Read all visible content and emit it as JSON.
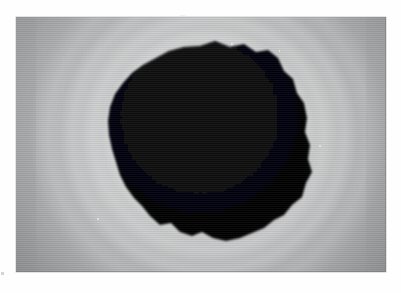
{
  "document": {
    "title": "Grayscale Specimen Micrograph",
    "background_color": "#fefefe",
    "width": 401,
    "height": 293
  },
  "plate": {
    "name": "photographic-plate",
    "x": 16,
    "y": 17,
    "width": 370,
    "height": 255,
    "corner_gray": "#6e7071",
    "mid_gray": "#a8a9aa",
    "halo_peak_gray": "#c4c5c6",
    "border_gray": "#c9cacb",
    "alt_text": "Backlit grayscale image of a dark, irregular rock-like specimen silhouetted against a bright diffuse halo with faint concentric rings",
    "modality": "transmitted-light / radiographic grayscale"
  },
  "specimen": {
    "name": "dark-irregular-specimen",
    "fill_color": "#050506",
    "description": "Opaque angular blob with a rough, jagged outline; widest across the middle, a shallow notch at the lower centre and a peaked ridge at the top.",
    "center_x_pct": 52,
    "center_y_pct": 46,
    "approx_width_px": 200,
    "approx_height_px": 195,
    "outline_points": "184,29 199,24 214,30 228,27 240,35 252,33 262,41 268,54 277,62 281,76 288,86 291,101 289,115 294,128 292,142 296,155 290,166 286,180 276,188 268,198 258,203 248,211 236,216 224,221 210,224 197,221 186,215 176,219 164,215 155,206 144,208 134,199 126,189 118,181 110,170 104,158 100,145 96,132 93,118 92,104 94,90 99,77 107,66 116,56 127,48 140,41 153,34 168,30"
  },
  "halo": {
    "name": "diffraction-halo",
    "ring_count": 4,
    "brightest_ring_gray": "#c6c7c8",
    "description": "Soft concentric luminous rings decreasing in brightness outward from the specimen toward the plate corners"
  },
  "specks": [
    {
      "name": "bright-speck-top",
      "x_pct": 58,
      "y_pct": 10,
      "size": 2.2
    },
    {
      "name": "bright-speck-upper-right",
      "x_pct": 71,
      "y_pct": 13,
      "size": 1.8
    },
    {
      "name": "bright-speck-right",
      "x_pct": 82,
      "y_pct": 50,
      "size": 2.0
    },
    {
      "name": "bright-speck-lower-left",
      "x_pct": 22,
      "y_pct": 79,
      "size": 1.6
    }
  ],
  "margin_marks": [
    {
      "name": "margin-mark-lower-left",
      "x": 1,
      "y": 272,
      "width": 3,
      "height": 3
    },
    {
      "name": "margin-mark-upper-center",
      "x": 180,
      "y": 15,
      "width": 5,
      "height": 1
    }
  ],
  "caption": {
    "text": ""
  }
}
